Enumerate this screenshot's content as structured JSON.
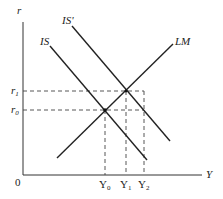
{
  "diagram": {
    "axes": {
      "y_label": "r",
      "x_label": "Y",
      "origin_label": "0"
    },
    "curves": [
      {
        "id": "IS",
        "label": "IS",
        "x1": 50,
        "y1": 46,
        "x2": 147,
        "y2": 160
      },
      {
        "id": "IS_prime",
        "label": "IS'",
        "x1": 72,
        "y1": 26,
        "x2": 170,
        "y2": 141
      },
      {
        "id": "LM",
        "label": "LM",
        "x1": 57,
        "y1": 158,
        "x2": 173,
        "y2": 44
      }
    ],
    "r_levels": [
      {
        "label": "r",
        "sub": "1",
        "y": 91
      },
      {
        "label": "r",
        "sub": "0",
        "y": 110
      }
    ],
    "y_levels": [
      {
        "label": "Y",
        "sub": "0",
        "x": 105
      },
      {
        "label": "Y",
        "sub": "1",
        "x": 126
      },
      {
        "label": "Y",
        "sub": "2",
        "x": 144
      }
    ],
    "colors": {
      "line": "#222222",
      "dashed": "#444444"
    }
  }
}
